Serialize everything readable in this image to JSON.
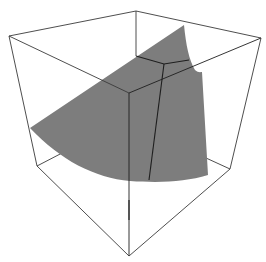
{
  "figure": {
    "type": "3d-surface-plot",
    "background": "#ffffff",
    "box_color": "#3a3a3a",
    "surface_color": "#7d7d7d",
    "mesh_color": "#1e1e1e",
    "axes_labels_visible": false,
    "ticks_visible": false
  },
  "box": {
    "vertices": {
      "top_back": [
        136,
        11
      ],
      "top_left": [
        9,
        36
      ],
      "top_right": [
        261,
        38
      ],
      "top_front": [
        129,
        93
      ],
      "bottom_left": [
        37,
        166
      ],
      "bottom_right": [
        230,
        169
      ],
      "bottom_front": [
        129,
        256
      ],
      "bottom_back": [
        139,
        140
      ]
    }
  },
  "surface": {
    "description": "Curved gray sheet (quarter-disc-like patch) crossing the bounding box, with two mesh lines"
  }
}
